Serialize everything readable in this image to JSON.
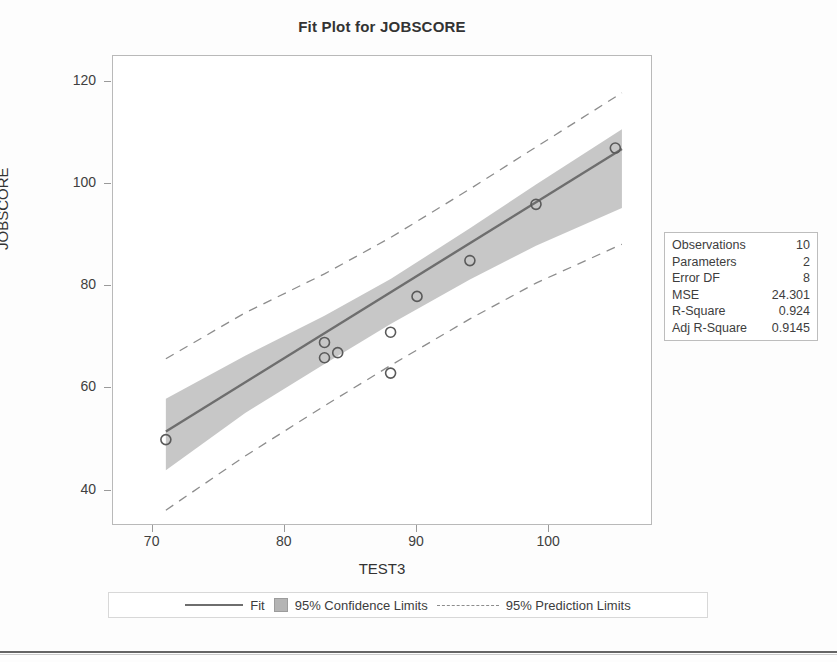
{
  "title": "Fit Plot for JOBSCORE",
  "axes": {
    "xlabel": "TEST3",
    "ylabel": "JOBSCORE",
    "xticks": [
      70,
      80,
      90,
      100
    ],
    "yticks": [
      40,
      60,
      80,
      100,
      120
    ]
  },
  "stats": {
    "rows": [
      {
        "key": "Observations",
        "value": "10"
      },
      {
        "key": "Parameters",
        "value": "2"
      },
      {
        "key": "Error DF",
        "value": "8"
      },
      {
        "key": "MSE",
        "value": "24.301"
      },
      {
        "key": "R-Square",
        "value": "0.924"
      },
      {
        "key": "Adj R-Square",
        "value": "0.9145"
      }
    ]
  },
  "legend": {
    "fit": "Fit",
    "confidence": "95% Confidence Limits",
    "prediction": "95% Prediction Limits"
  },
  "colors": {
    "fit_line": "#6e6e6e",
    "confidence_band": "#b4b4b4",
    "prediction_line": "#8d8d8d",
    "marker": "#5a5a5a",
    "frame": "#b9b9b9",
    "text": "#3a3a3a"
  },
  "chart_data": {
    "type": "scatter",
    "title": "Fit Plot for JOBSCORE",
    "xlabel": "TEST3",
    "ylabel": "JOBSCORE",
    "xlim": [
      67,
      107.7
    ],
    "ylim": [
      33.5,
      125
    ],
    "grid": false,
    "legend_position": "bottom",
    "x": [
      71,
      83,
      83,
      84,
      88,
      88,
      90,
      94,
      99,
      105
    ],
    "y": [
      50,
      69,
      66,
      67,
      71,
      63,
      78,
      85,
      96,
      107
    ],
    "points": [
      {
        "x": 71,
        "y": 50
      },
      {
        "x": 83,
        "y": 69
      },
      {
        "x": 83,
        "y": 66
      },
      {
        "x": 84,
        "y": 67
      },
      {
        "x": 88,
        "y": 71
      },
      {
        "x": 88,
        "y": 63
      },
      {
        "x": 90,
        "y": 78
      },
      {
        "x": 94,
        "y": 85
      },
      {
        "x": 99,
        "y": 96
      },
      {
        "x": 105,
        "y": 107
      }
    ],
    "fit": {
      "slope": 1.6,
      "intercept": -62.0,
      "x_start": 71,
      "x_end": 105.5
    },
    "confidence_limits": {
      "level": 0.95,
      "x": [
        71,
        77,
        83,
        88,
        94,
        99,
        105.5
      ],
      "lower": [
        44.0,
        55.2,
        64.8,
        72.6,
        81.3,
        87.9,
        95.3
      ],
      "upper": [
        58.0,
        66.4,
        74.2,
        81.4,
        91.3,
        99.9,
        110.7
      ]
    },
    "prediction_limits": {
      "level": 0.95,
      "x": [
        71,
        77,
        83,
        88,
        94,
        99,
        105.5
      ],
      "lower": [
        36.2,
        46.8,
        56.6,
        64.5,
        73.6,
        80.6,
        88.2
      ],
      "upper": [
        65.8,
        74.8,
        82.4,
        89.5,
        99.0,
        107.2,
        117.8
      ]
    }
  }
}
